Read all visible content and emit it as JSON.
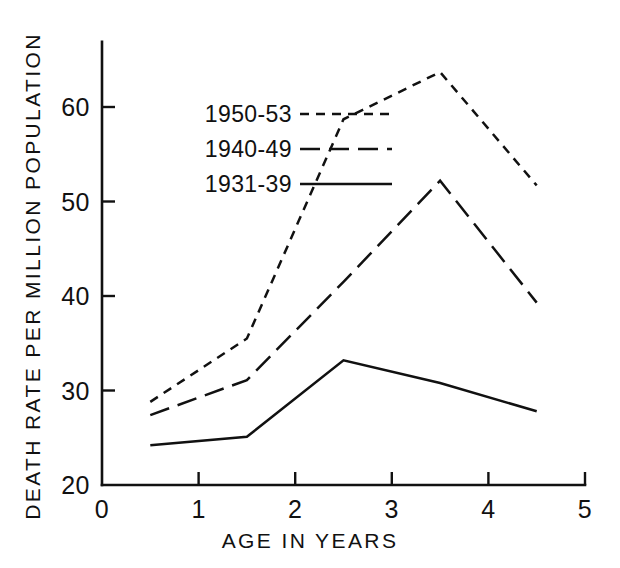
{
  "chart_data": {
    "type": "line",
    "title": "",
    "xlabel": "AGE IN YEARS",
    "ylabel": "DEATH RATE PER MILLION POPULATION",
    "x": [
      0.5,
      1.5,
      2.5,
      3.5,
      4.5
    ],
    "xlim": [
      0,
      5
    ],
    "ylim": [
      20,
      65
    ],
    "xticks": [
      "0",
      "1",
      "2",
      "3",
      "4",
      "5"
    ],
    "xtick_values": [
      0,
      1,
      2,
      3,
      4,
      5
    ],
    "yticks": [
      "20",
      "30",
      "40",
      "50",
      "60"
    ],
    "ytick_values": [
      20,
      30,
      40,
      50,
      60
    ],
    "grid": false,
    "legend_position": "upper-left-inside",
    "series": [
      {
        "name": "1950-53",
        "style": "dotted-dash",
        "dash_pattern": "9 7",
        "values": [
          28.8,
          35.5,
          58.7,
          63.7,
          51.7
        ]
      },
      {
        "name": "1940-49",
        "style": "dashed",
        "dash_pattern": "20 9",
        "values": [
          27.4,
          31.1,
          41.5,
          52.2,
          39.3
        ]
      },
      {
        "name": "1931-39",
        "style": "solid",
        "dash_pattern": "none",
        "values": [
          24.2,
          25.1,
          33.2,
          30.8,
          27.8
        ]
      }
    ]
  },
  "legend": {
    "items": [
      {
        "label": "1950-53"
      },
      {
        "label": "1940-49"
      },
      {
        "label": "1931-39"
      }
    ]
  },
  "colors": {
    "ink": "#111111",
    "background": "#ffffff"
  }
}
